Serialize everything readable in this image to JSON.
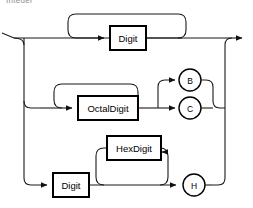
{
  "diagram": {
    "kind": "railroad-syntax-diagram",
    "title_fragment": "Integer",
    "stroke_color": "#1a1a1a",
    "box_stroke_color": "#000000",
    "background_color": "#ffffff",
    "entry": {
      "name": "entry-rail",
      "label": ""
    },
    "exit": {
      "name": "exit-rail",
      "label": ""
    },
    "branches": [
      {
        "id": "decimal",
        "element_label": "Digit",
        "element_type": "nonterminal-box",
        "has_repeat_loop": true,
        "terminals": []
      },
      {
        "id": "octal",
        "element_label": "OctalDigit",
        "element_type": "nonterminal-box",
        "has_repeat_loop": true,
        "terminals": [
          "B",
          "C"
        ]
      },
      {
        "id": "hex",
        "element_label": "Digit",
        "element_type": "nonterminal-box",
        "second_element_label": "HexDigit",
        "second_element_type": "nonterminal-box",
        "has_repeat_loop": true,
        "terminals": [
          "H"
        ]
      }
    ],
    "boxes": [
      {
        "name": "digit-box-top",
        "label": "Digit"
      },
      {
        "name": "octaldigit-box",
        "label": "OctalDigit"
      },
      {
        "name": "hexdigit-box",
        "label": "HexDigit"
      },
      {
        "name": "digit-box-bottom",
        "label": "Digit"
      }
    ],
    "terminal_nodes": [
      {
        "name": "terminal-b",
        "label": "B"
      },
      {
        "name": "terminal-c",
        "label": "C"
      },
      {
        "name": "terminal-h",
        "label": "H"
      }
    ]
  }
}
